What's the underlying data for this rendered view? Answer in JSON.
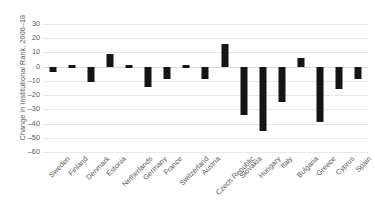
{
  "chart_data": {
    "type": "bar",
    "title": "",
    "subtitle": "",
    "xlabel": "",
    "ylabel": "Change in Institutional Rank, 2006–18",
    "ylim": [
      -60,
      30
    ],
    "ytick_values": [
      30,
      20,
      10,
      0,
      -10,
      -20,
      -30,
      -40,
      -50,
      -60
    ],
    "ytick_labels": [
      "30",
      "20",
      "10",
      "0",
      "–10",
      "–20",
      "–30",
      "–40",
      "–50",
      "–60"
    ],
    "grid": true,
    "grid_axis": "y",
    "legend": false,
    "legend_position": "none",
    "bar_color": "#151515",
    "categories": [
      "Sweden",
      "Finland",
      "Denmark",
      "Estonia",
      "Netherlands",
      "Germany",
      "France",
      "Switzerland",
      "Austria",
      "Czech Republic",
      "Slovakia",
      "Hungary",
      "Italy",
      "Bulgaria",
      "Greece",
      "Cyprus",
      "Spain"
    ],
    "values": [
      -4,
      0,
      -11,
      9,
      2,
      -14,
      -9,
      0,
      -9,
      16,
      -34,
      -45,
      -25,
      6,
      -39,
      -16,
      -9
    ]
  }
}
